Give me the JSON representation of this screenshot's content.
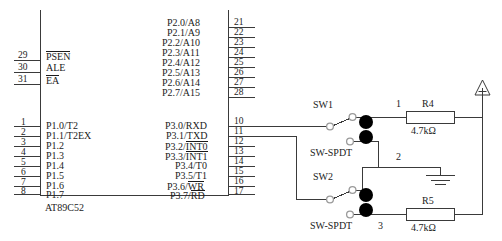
{
  "diagram": {
    "chip": {
      "part_number": "AT89C52",
      "left_pins": [
        {
          "number": "29",
          "label": "PSEN",
          "overbar": true
        },
        {
          "number": "30",
          "label": "ALE",
          "overbar": false
        },
        {
          "number": "31",
          "label": "EA",
          "overbar": true
        },
        {
          "number": "1",
          "label": "P1.0/T2",
          "overbar": false
        },
        {
          "number": "2",
          "label": "P1.1/T2EX",
          "overbar": false
        },
        {
          "number": "3",
          "label": "P1.2",
          "overbar": false
        },
        {
          "number": "4",
          "label": "P1.3",
          "overbar": false
        },
        {
          "number": "5",
          "label": "P1.4",
          "overbar": false
        },
        {
          "number": "6",
          "label": "P1.5",
          "overbar": false
        },
        {
          "number": "7",
          "label": "P1.6",
          "overbar": false
        },
        {
          "number": "8",
          "label": "P1.7",
          "overbar": false
        }
      ],
      "right_pins_port2": [
        {
          "number": "21",
          "label": "P2.0/A8"
        },
        {
          "number": "22",
          "label": "P2.1/A9"
        },
        {
          "number": "23",
          "label": "P2.2/A10"
        },
        {
          "number": "24",
          "label": "P2.3/A11"
        },
        {
          "number": "25",
          "label": "P2.4/A12"
        },
        {
          "number": "26",
          "label": "P2.5/A13"
        },
        {
          "number": "27",
          "label": "P2.6/A14"
        },
        {
          "number": "28",
          "label": "P2.7/A15"
        }
      ],
      "right_pins_port3": [
        {
          "number": "10",
          "prefix": "P3.0/",
          "suffix": "RXD",
          "overbar": false
        },
        {
          "number": "11",
          "prefix": "P3.1/",
          "suffix": "TXD",
          "overbar": false
        },
        {
          "number": "12",
          "prefix": "P3.2/",
          "suffix": "INT0",
          "overbar": true
        },
        {
          "number": "13",
          "prefix": "P3.3/",
          "suffix": "INT1",
          "overbar": true
        },
        {
          "number": "14",
          "prefix": "P3.4/",
          "suffix": "T0",
          "overbar": false
        },
        {
          "number": "15",
          "prefix": "P3.5/",
          "suffix": "T1",
          "overbar": false
        },
        {
          "number": "16",
          "prefix": "P3.6/",
          "suffix": "WR",
          "overbar": true
        },
        {
          "number": "17",
          "prefix": "P3.7/",
          "suffix": "RD",
          "overbar": true
        }
      ]
    },
    "switches": [
      {
        "name": "SW1",
        "type": "SW-SPDT"
      },
      {
        "name": "SW2",
        "type": "SW-SPDT"
      }
    ],
    "resistors": [
      {
        "name": "R4",
        "value": "4.7kΩ"
      },
      {
        "name": "R5",
        "value": "4.7kΩ"
      }
    ],
    "node_labels": [
      "1",
      "2",
      "3"
    ],
    "symbols": {
      "power": "vcc-triangle",
      "ground": "earth-ground"
    },
    "colors": {
      "wire": "#3a3a3a",
      "text": "#1b1b1b",
      "terminal_open": "#9a9a9a",
      "terminal_filled": "#000000",
      "background": "#ffffff"
    }
  }
}
